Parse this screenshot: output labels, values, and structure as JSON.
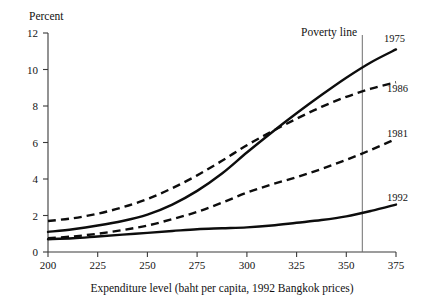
{
  "chart_data": {
    "type": "line",
    "title": "",
    "ylabel": "Percent",
    "xlabel": "Expenditure level (baht per capita, 1992 Bangkok prices)",
    "xlim": [
      200,
      375
    ],
    "ylim": [
      0,
      12
    ],
    "xticks": [
      200,
      225,
      250,
      275,
      300,
      325,
      350,
      375
    ],
    "xtick_labels": [
      "200",
      "225",
      "250",
      "275",
      "300",
      "325",
      "350",
      "375"
    ],
    "yticks": [
      0,
      2,
      4,
      6,
      8,
      10,
      12
    ],
    "ytick_labels": [
      "0",
      "2",
      "4",
      "6",
      "8",
      "10",
      "12"
    ],
    "grid": false,
    "legend_position": "inline-right-end-labels",
    "annotations": [
      {
        "name": "poverty-line",
        "label": "Poverty line",
        "x": 358,
        "type": "vertical-rule"
      }
    ],
    "x": [
      200,
      212.5,
      225,
      237.5,
      250,
      262.5,
      275,
      287.5,
      300,
      312.5,
      325,
      337.5,
      350,
      362.5,
      375
    ],
    "series": [
      {
        "name": "1975",
        "label": "1975",
        "style": "solid",
        "color": "#0d0d0d",
        "values": [
          1.1,
          1.25,
          1.45,
          1.7,
          2.05,
          2.6,
          3.35,
          4.3,
          5.45,
          6.55,
          7.6,
          8.6,
          9.55,
          10.4,
          11.1
        ]
      },
      {
        "name": "1986",
        "label": "1986",
        "style": "dashed",
        "color": "#0d0d0d",
        "values": [
          1.7,
          1.85,
          2.1,
          2.45,
          2.9,
          3.5,
          4.2,
          5.0,
          5.85,
          6.6,
          7.3,
          7.95,
          8.5,
          8.95,
          9.3
        ]
      },
      {
        "name": "1981",
        "label": "1981",
        "style": "dashed",
        "color": "#0d0d0d",
        "values": [
          0.75,
          0.85,
          1.0,
          1.2,
          1.45,
          1.8,
          2.2,
          2.7,
          3.25,
          3.7,
          4.1,
          4.55,
          5.05,
          5.6,
          6.2
        ]
      },
      {
        "name": "1992",
        "label": "1992",
        "style": "solid",
        "color": "#0d0d0d",
        "values": [
          0.7,
          0.75,
          0.85,
          0.95,
          1.05,
          1.15,
          1.25,
          1.3,
          1.35,
          1.45,
          1.6,
          1.75,
          1.95,
          2.25,
          2.6
        ]
      }
    ]
  },
  "figure": {
    "ylabel_head": "Percent",
    "xlabel": "Expenditure level (baht per capita, 1992 Bangkok prices)",
    "poverty_label": "Poverty line",
    "series_labels": {
      "s1975": "1975",
      "s1986": "1986",
      "s1981": "1981",
      "s1992": "1992"
    },
    "xtick_labels": {
      "t0": "200",
      "t1": "225",
      "t2": "250",
      "t3": "275",
      "t4": "300",
      "t5": "325",
      "t6": "350",
      "t7": "375"
    },
    "ytick_labels": {
      "t0": "0",
      "t1": "2",
      "t2": "4",
      "t3": "6",
      "t4": "8",
      "t5": "10",
      "t6": "12"
    }
  }
}
